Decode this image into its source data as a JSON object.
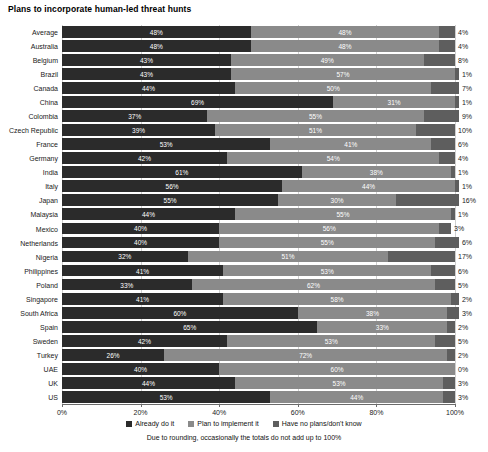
{
  "chart_data": {
    "type": "bar",
    "subtype": "stacked-horizontal-100",
    "title": "Plans to incorporate human-led threat hunts",
    "xlabel": "",
    "ylabel": "",
    "xlim": [
      0,
      100
    ],
    "grid": true,
    "legend_position": "bottom",
    "footnote": "Due to rounding, occasionally the totals do not add up to 100%",
    "x_ticks": [
      "0%",
      "20%",
      "40%",
      "60%",
      "80%",
      "100%"
    ],
    "x_tick_values": [
      0,
      20,
      40,
      60,
      80,
      100
    ],
    "categories": [
      "Average",
      "Australia",
      "Belgium",
      "Brazil",
      "Canada",
      "China",
      "Colombia",
      "Czech Republic",
      "France",
      "Germany",
      "India",
      "Italy",
      "Japan",
      "Malaysia",
      "Mexico",
      "Netherlands",
      "Nigeria",
      "Philippines",
      "Poland",
      "Singapore",
      "South Africa",
      "Spain",
      "Sweden",
      "Turkey",
      "UAE",
      "UK",
      "US"
    ],
    "series": [
      {
        "name": "Already do it",
        "color": "#2b2b2b",
        "values": [
          48,
          48,
          43,
          43,
          44,
          69,
          37,
          39,
          53,
          42,
          61,
          56,
          55,
          44,
          40,
          40,
          32,
          41,
          33,
          41,
          60,
          65,
          42,
          26,
          40,
          44,
          53
        ],
        "labels": [
          "48%",
          "48%",
          "43%",
          "43%",
          "44%",
          "69%",
          "37%",
          "39%",
          "53%",
          "42%",
          "61%",
          "56%",
          "55%",
          "44%",
          "40%",
          "40%",
          "32%",
          "41%",
          "33%",
          "41%",
          "60%",
          "65%",
          "42%",
          "26%",
          "40%",
          "44%",
          "53%"
        ]
      },
      {
        "name": "Plan to implement it",
        "color": "#8a8a8a",
        "values": [
          48,
          48,
          49,
          57,
          50,
          31,
          55,
          51,
          41,
          54,
          38,
          44,
          30,
          55,
          56,
          55,
          51,
          53,
          62,
          58,
          38,
          33,
          53,
          72,
          60,
          53,
          44
        ],
        "labels": [
          "48%",
          "48%",
          "49%",
          "57%",
          "50%",
          "31%",
          "55%",
          "51%",
          "41%",
          "54%",
          "38%",
          "44%",
          "30%",
          "55%",
          "56%",
          "55%",
          "51%",
          "53%",
          "62%",
          "58%",
          "38%",
          "33%",
          "53%",
          "72%",
          "60%",
          "53%",
          "44%"
        ]
      },
      {
        "name": "Have no plans/don't know",
        "color": "#5e5e5e",
        "values": [
          4,
          4,
          8,
          1,
          7,
          1,
          9,
          10,
          6,
          4,
          1,
          1,
          16,
          1,
          3,
          6,
          17,
          6,
          5,
          2,
          3,
          2,
          5,
          2,
          0,
          3,
          3
        ],
        "labels": [
          "4%",
          "4%",
          "8%",
          "1%",
          "7%",
          "1%",
          "9%",
          "10%",
          "6%",
          "4%",
          "1%",
          "1%",
          "16%",
          "1%",
          "3%",
          "6%",
          "17%",
          "6%",
          "5%",
          "2%",
          "3%",
          "2%",
          "5%",
          "2%",
          "0%",
          "3%",
          "3%"
        ]
      }
    ]
  }
}
